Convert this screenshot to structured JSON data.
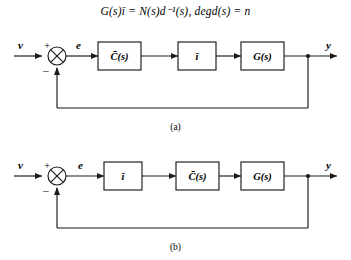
{
  "equation": {
    "text": "G(s)ī  =  N(s)d⁻¹(s),   degd(s)  =  n"
  },
  "diagrams": [
    {
      "id": "a",
      "caption": "(a)",
      "input_label": "v",
      "output_label": "y",
      "error_label": "e",
      "sum_plus": "+",
      "sum_minus": "–",
      "blocks": [
        {
          "label": "C̄(s)"
        },
        {
          "label": "ī"
        },
        {
          "label": "G(s)"
        }
      ]
    },
    {
      "id": "b",
      "caption": "(b)",
      "input_label": "v",
      "output_label": "y",
      "error_label": "e",
      "sum_plus": "+",
      "sum_minus": "–",
      "blocks": [
        {
          "label": "ī"
        },
        {
          "label": "C̄(s)"
        },
        {
          "label": "G(s)"
        }
      ]
    }
  ],
  "colors": {
    "line": "#1a1a1a",
    "background": "#ffffff"
  }
}
